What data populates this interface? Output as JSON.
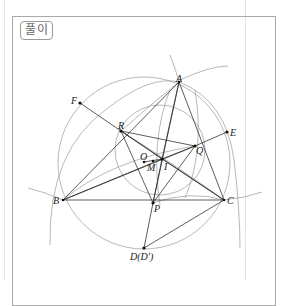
{
  "header": {
    "label": "풀이"
  },
  "diagram": {
    "points": [
      {
        "name": "A",
        "x": 179,
        "y": 82
      },
      {
        "name": "B",
        "x": 63,
        "y": 200
      },
      {
        "name": "C",
        "x": 224,
        "y": 200
      },
      {
        "name": "P",
        "x": 153,
        "y": 203
      },
      {
        "name": "D(D')",
        "x": 144,
        "y": 248
      },
      {
        "name": "I",
        "x": 162,
        "y": 159
      },
      {
        "name": "M",
        "x": 153,
        "y": 161
      },
      {
        "name": "O",
        "x": 144,
        "y": 162
      },
      {
        "name": "R",
        "x": 121,
        "y": 131
      },
      {
        "name": "Q",
        "x": 195,
        "y": 146
      },
      {
        "name": "E",
        "x": 227,
        "y": 132
      },
      {
        "name": "F",
        "x": 80,
        "y": 103
      }
    ],
    "labels": {
      "A": "A",
      "B": "B",
      "C": "C",
      "P": "P",
      "D": "D(D')",
      "I": "I",
      "M": "M",
      "O": "O",
      "R": "R",
      "Q": "Q",
      "E": "E",
      "F": "F"
    }
  }
}
